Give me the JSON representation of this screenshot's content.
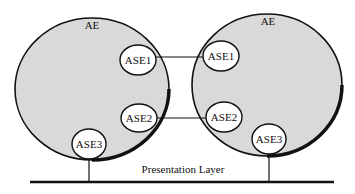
{
  "diagram": {
    "colors": {
      "background": "#ffffff",
      "entity_fill": "#d9d9d9",
      "element_fill": "#ffffff",
      "stroke": "#111111"
    },
    "entities": [
      {
        "label": "AE",
        "elements": [
          {
            "label": "ASE1"
          },
          {
            "label": "ASE2"
          },
          {
            "label": "ASE3"
          }
        ]
      },
      {
        "label": "AE",
        "elements": [
          {
            "label": "ASE1"
          },
          {
            "label": "ASE2"
          },
          {
            "label": "ASE3"
          }
        ]
      }
    ],
    "connections": [
      {
        "from": "ASE1",
        "to": "ASE1"
      },
      {
        "from": "ASE2",
        "to": "ASE2"
      }
    ],
    "layer": {
      "label": "Presentation Layer"
    }
  }
}
